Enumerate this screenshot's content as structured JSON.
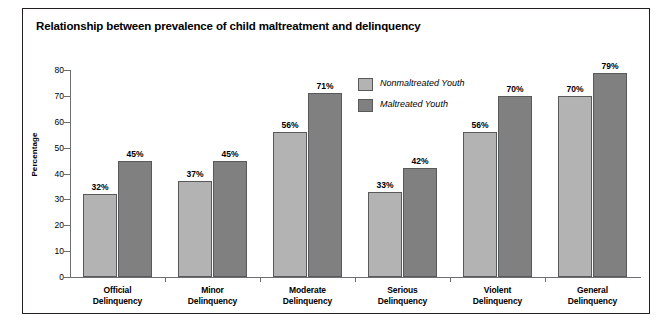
{
  "chart_data": {
    "type": "bar",
    "title": "Relationship between prevalence of child maltreatment and delinquency",
    "xlabel": "",
    "ylabel": "Percentage",
    "ylim": [
      0,
      80
    ],
    "yticks": [
      0,
      10,
      20,
      30,
      40,
      50,
      60,
      70,
      80
    ],
    "grid": false,
    "legend_position": "inside-upper-center",
    "categories": [
      "Official\nDelinquency",
      "Minor\nDelinquency",
      "Moderate\nDelinquency",
      "Serious\nDelinquency",
      "Violent\nDelinquency",
      "General\nDelinquency"
    ],
    "category_lines": [
      [
        "Official",
        "Delinquency"
      ],
      [
        "Minor",
        "Delinquency"
      ],
      [
        "Moderate",
        "Delinquency"
      ],
      [
        "Serious",
        "Delinquency"
      ],
      [
        "Violent",
        "Delinquency"
      ],
      [
        "General",
        "Delinquency"
      ]
    ],
    "series": [
      {
        "name": "Nonmaltreated Youth",
        "color": "#b3b3b3",
        "values": [
          32,
          37,
          56,
          33,
          56,
          70
        ],
        "value_labels": [
          "32%",
          "37%",
          "56%",
          "33%",
          "56%",
          "70%"
        ]
      },
      {
        "name": "Maltreated Youth",
        "color": "#808080",
        "values": [
          45,
          45,
          71,
          42,
          70,
          79
        ],
        "value_labels": [
          "45%",
          "45%",
          "71%",
          "42%",
          "70%",
          "79%"
        ]
      }
    ],
    "ytick_labels": [
      "0",
      "10",
      "20",
      "30",
      "40",
      "50",
      "60",
      "70",
      "80"
    ]
  },
  "colors": {
    "series_nonmaltreated": "#b3b3b3",
    "series_maltreated": "#808080",
    "axis": "#6d6e71",
    "bar_outline": "#58595b",
    "frame": "#231f20",
    "text": "#000000",
    "background": "#ffffff"
  }
}
